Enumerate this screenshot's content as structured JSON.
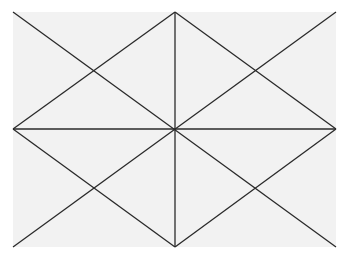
{
  "diagram": {
    "colors": {
      "background": "#ffffff",
      "paper": "#f2f2f2",
      "line": "#2a2a2a"
    },
    "lines": [
      {
        "id": "diagonal-tl-br",
        "from": "top-left-corner",
        "to": "bottom-right-corner"
      },
      {
        "id": "diagonal-tr-bl",
        "from": "top-right-corner",
        "to": "bottom-left-corner"
      },
      {
        "id": "vertical-center",
        "from": "top-midpoint",
        "to": "bottom-midpoint"
      },
      {
        "id": "horizontal-center",
        "from": "left-midpoint",
        "to": "right-midpoint"
      },
      {
        "id": "diamond-top-right",
        "from": "top-midpoint",
        "to": "right-midpoint"
      },
      {
        "id": "diamond-right-bottom",
        "from": "right-midpoint",
        "to": "bottom-midpoint"
      },
      {
        "id": "diamond-bottom-left",
        "from": "bottom-midpoint",
        "to": "left-midpoint"
      },
      {
        "id": "diamond-left-top",
        "from": "left-midpoint",
        "to": "top-midpoint"
      }
    ]
  }
}
